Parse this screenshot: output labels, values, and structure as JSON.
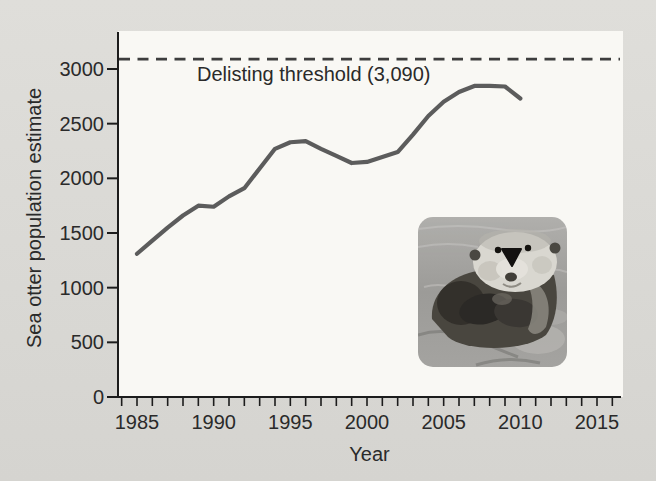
{
  "figure": {
    "colors": {
      "page_background_top": "#dfdeda",
      "page_background_bottom": "#d5d4d0",
      "panel": "#f9f8f4",
      "axis": "#1c1c1c",
      "text": "#2a2a2a",
      "series_line": "#5c5c5c",
      "threshold_line": "#3d3d3d"
    },
    "inset_photo": "sea-otter-photo"
  },
  "chart_data": {
    "type": "line",
    "title": "",
    "xlabel": "Year",
    "ylabel": "Sea otter population estimate",
    "xlim": [
      1983.8,
      2016.6
    ],
    "ylim": [
      0,
      3330
    ],
    "grid": false,
    "legend": "none",
    "x_tick_labels": [
      1985,
      1990,
      1995,
      2000,
      2005,
      2010,
      2015
    ],
    "x_minor_ticks": {
      "start": 1984,
      "end": 2016,
      "step": 1
    },
    "y_ticks": [
      0,
      500,
      1000,
      1500,
      2000,
      2500,
      3000
    ],
    "threshold": {
      "value": 3090,
      "label": "Delisting threshold (3,090)"
    },
    "series": [
      {
        "name": "Sea otter population estimate",
        "x": [
          1985,
          1986,
          1987,
          1988,
          1989,
          1990,
          1991,
          1992,
          1993,
          1994,
          1995,
          1996,
          1997,
          1998,
          1999,
          2000,
          2001,
          2002,
          2003,
          2004,
          2005,
          2006,
          2007,
          2008,
          2009,
          2010
        ],
        "y": [
          1310,
          1430,
          1550,
          1660,
          1750,
          1740,
          1835,
          1910,
          2090,
          2270,
          2330,
          2340,
          2270,
          2205,
          2140,
          2150,
          2195,
          2240,
          2400,
          2570,
          2700,
          2790,
          2845,
          2845,
          2840,
          2730
        ]
      }
    ]
  }
}
